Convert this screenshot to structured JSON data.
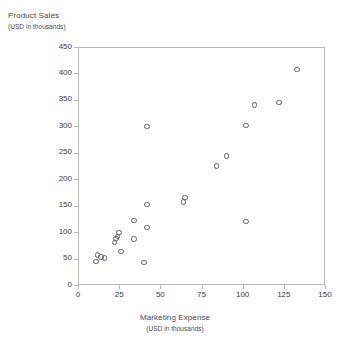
{
  "chart_data": {
    "type": "scatter",
    "title": "",
    "xlabel": "Marketing Expense",
    "xlabel_sub": "(USD in thousands)",
    "ylabel": "Product Sales",
    "ylabel_sub": "(USD in thousands)",
    "xlim": [
      0,
      150
    ],
    "ylim": [
      0,
      450
    ],
    "xticks": [
      0,
      25,
      50,
      75,
      100,
      125,
      150
    ],
    "yticks": [
      0,
      50,
      100,
      150,
      200,
      250,
      300,
      350,
      400,
      450
    ],
    "xtick_labels": [
      "0",
      "25",
      "50",
      "75",
      "100",
      "125",
      "150"
    ],
    "ytick_labels": [
      "0",
      "50",
      "100",
      "150",
      "200",
      "250",
      "300",
      "350",
      "400",
      "450"
    ],
    "grid": false,
    "legend": false,
    "marker": "open-circle",
    "marker_color": "#5d5d66",
    "points": [
      {
        "x": 11,
        "y": 45
      },
      {
        "x": 12,
        "y": 57
      },
      {
        "x": 14,
        "y": 53
      },
      {
        "x": 16,
        "y": 51
      },
      {
        "x": 22,
        "y": 80
      },
      {
        "x": 23,
        "y": 88
      },
      {
        "x": 24,
        "y": 92
      },
      {
        "x": 25,
        "y": 99
      },
      {
        "x": 26,
        "y": 63
      },
      {
        "x": 34,
        "y": 122
      },
      {
        "x": 34,
        "y": 87
      },
      {
        "x": 40,
        "y": 43
      },
      {
        "x": 42,
        "y": 152
      },
      {
        "x": 42,
        "y": 109
      },
      {
        "x": 42,
        "y": 300
      },
      {
        "x": 64,
        "y": 157
      },
      {
        "x": 65,
        "y": 166
      },
      {
        "x": 84,
        "y": 225
      },
      {
        "x": 90,
        "y": 244
      },
      {
        "x": 102,
        "y": 120
      },
      {
        "x": 102,
        "y": 302
      },
      {
        "x": 107,
        "y": 340
      },
      {
        "x": 122,
        "y": 345
      },
      {
        "x": 133,
        "y": 407
      }
    ]
  }
}
